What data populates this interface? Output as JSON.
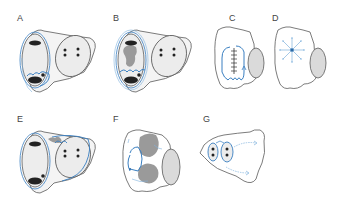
{
  "figure": {
    "panels": [
      {
        "id": "A",
        "label": "A"
      },
      {
        "id": "B",
        "label": "B"
      },
      {
        "id": "C",
        "label": "C"
      },
      {
        "id": "D",
        "label": "D"
      },
      {
        "id": "E",
        "label": "E"
      },
      {
        "id": "F",
        "label": "F"
      },
      {
        "id": "G",
        "label": "G"
      }
    ],
    "colors": {
      "outline": "#5a5a5a",
      "fill": "#f2f2f2",
      "chamber_fill": "#e8e8e8",
      "blue": "#3a7fc1",
      "light_blue": "#7fb2dd",
      "dark": "#222222",
      "gray_mass": "#9a9a9a"
    }
  }
}
